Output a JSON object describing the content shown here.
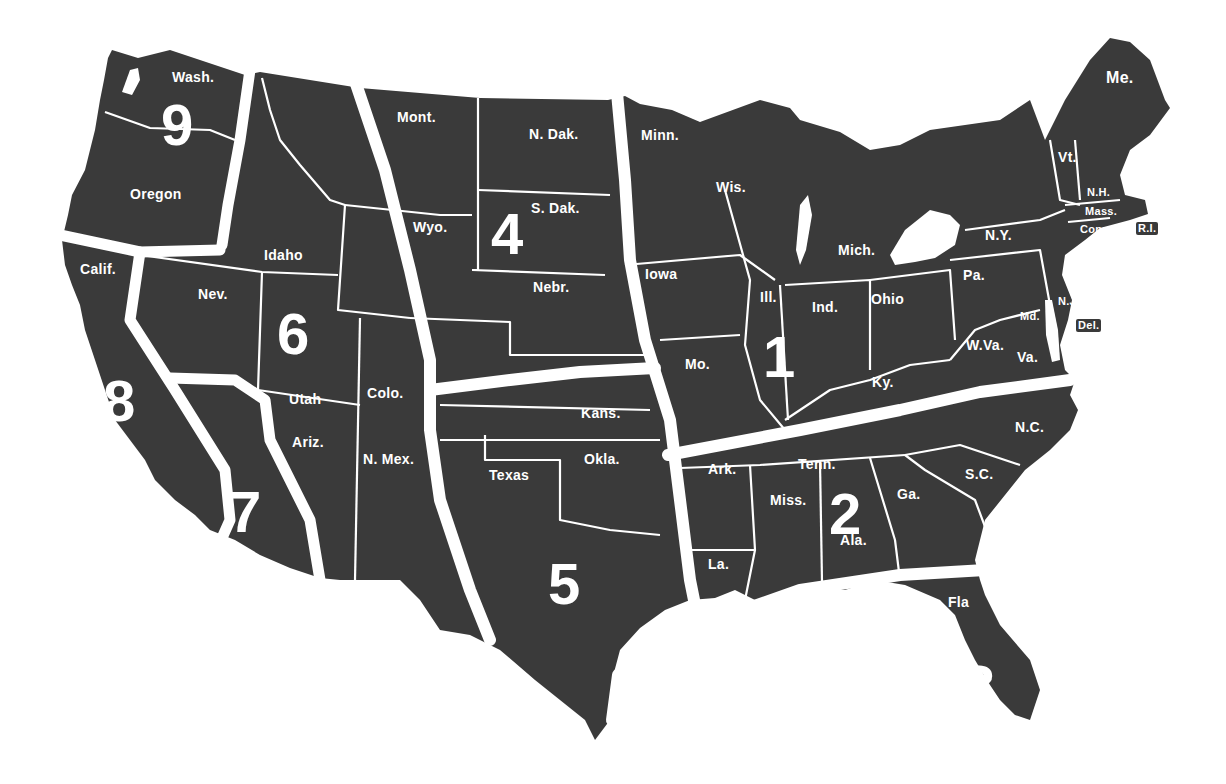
{
  "map": {
    "title": "U.S. Regions Map",
    "colors": {
      "land": "#3a3a3a",
      "divider": "#ffffff",
      "background": "#ffffff",
      "text": "#ffffff"
    },
    "regions": [
      {
        "number": "1",
        "x": 763,
        "y": 328
      },
      {
        "number": "2",
        "x": 829,
        "y": 485
      },
      {
        "number": "3",
        "x": 963,
        "y": 657
      },
      {
        "number": "4",
        "x": 491,
        "y": 205
      },
      {
        "number": "5",
        "x": 548,
        "y": 555
      },
      {
        "number": "6",
        "x": 277,
        "y": 305
      },
      {
        "number": "7",
        "x": 229,
        "y": 483
      },
      {
        "number": "8",
        "x": 103,
        "y": 372
      },
      {
        "number": "9",
        "x": 161,
        "y": 96
      }
    ],
    "states": [
      {
        "label": "Wash.",
        "x": 172,
        "y": 70,
        "size": "med"
      },
      {
        "label": "Oregon",
        "x": 130,
        "y": 187,
        "size": "med"
      },
      {
        "label": "Calif.",
        "x": 80,
        "y": 262,
        "size": "med"
      },
      {
        "label": "Idaho",
        "x": 264,
        "y": 248,
        "size": "med"
      },
      {
        "label": "Nev.",
        "x": 198,
        "y": 287,
        "size": "med"
      },
      {
        "label": "Utah",
        "x": 289,
        "y": 392,
        "size": "med"
      },
      {
        "label": "Ariz.",
        "x": 292,
        "y": 435,
        "size": "med"
      },
      {
        "label": "Mont.",
        "x": 397,
        "y": 110,
        "size": "med"
      },
      {
        "label": "Wyo.",
        "x": 413,
        "y": 220,
        "size": "med"
      },
      {
        "label": "Colo.",
        "x": 367,
        "y": 386,
        "size": "med"
      },
      {
        "label": "N. Mex.",
        "x": 363,
        "y": 452,
        "size": "med"
      },
      {
        "label": "N. Dak.",
        "x": 529,
        "y": 127,
        "size": "med"
      },
      {
        "label": "S. Dak.",
        "x": 531,
        "y": 201,
        "size": "med"
      },
      {
        "label": "Nebr.",
        "x": 533,
        "y": 280,
        "size": "med"
      },
      {
        "label": "Kans.",
        "x": 581,
        "y": 406,
        "size": "med"
      },
      {
        "label": "Okla.",
        "x": 584,
        "y": 452,
        "size": "med"
      },
      {
        "label": "Texas",
        "x": 489,
        "y": 468,
        "size": "med"
      },
      {
        "label": "Minn.",
        "x": 641,
        "y": 128,
        "size": "med"
      },
      {
        "label": "Iowa",
        "x": 645,
        "y": 267,
        "size": "med"
      },
      {
        "label": "Mo.",
        "x": 685,
        "y": 357,
        "size": "med"
      },
      {
        "label": "Ark.",
        "x": 708,
        "y": 462,
        "size": "med"
      },
      {
        "label": "La.",
        "x": 708,
        "y": 557,
        "size": "med"
      },
      {
        "label": "Wis.",
        "x": 716,
        "y": 180,
        "size": "med"
      },
      {
        "label": "Ill.",
        "x": 760,
        "y": 290,
        "size": "med"
      },
      {
        "label": "Ind.",
        "x": 812,
        "y": 300,
        "size": "med"
      },
      {
        "label": "Mich.",
        "x": 838,
        "y": 243,
        "size": "med"
      },
      {
        "label": "Ohio",
        "x": 871,
        "y": 292,
        "size": "med"
      },
      {
        "label": "Ky.",
        "x": 872,
        "y": 375,
        "size": "med"
      },
      {
        "label": "Tenn.",
        "x": 798,
        "y": 457,
        "size": "med"
      },
      {
        "label": "Miss.",
        "x": 770,
        "y": 493,
        "size": "med"
      },
      {
        "label": "Ala.",
        "x": 840,
        "y": 533,
        "size": "med"
      },
      {
        "label": "Ga.",
        "x": 897,
        "y": 487,
        "size": "med"
      },
      {
        "label": "Fla",
        "x": 948,
        "y": 595,
        "size": "med"
      },
      {
        "label": "S.C.",
        "x": 965,
        "y": 467,
        "size": "med"
      },
      {
        "label": "N.C.",
        "x": 1015,
        "y": 420,
        "size": "med"
      },
      {
        "label": "Va.",
        "x": 1017,
        "y": 350,
        "size": "med"
      },
      {
        "label": "W.Va.",
        "x": 966,
        "y": 338,
        "size": "med"
      },
      {
        "label": "Pa.",
        "x": 963,
        "y": 268,
        "size": "med"
      },
      {
        "label": "N.Y.",
        "x": 985,
        "y": 228,
        "size": "med"
      },
      {
        "label": "Vt.",
        "x": 1058,
        "y": 150,
        "size": "med"
      },
      {
        "label": "Me.",
        "x": 1106,
        "y": 70,
        "size": "big"
      },
      {
        "label": "N.H.",
        "x": 1087,
        "y": 187,
        "size": "small"
      },
      {
        "label": "Mass.",
        "x": 1085,
        "y": 206,
        "size": "small"
      },
      {
        "label": "Conn.",
        "x": 1080,
        "y": 224,
        "size": "small"
      },
      {
        "label": "R.I.",
        "x": 1136,
        "y": 222,
        "size": "small",
        "boxed": true
      },
      {
        "label": "N.J.",
        "x": 1058,
        "y": 296,
        "size": "small"
      },
      {
        "label": "Md.",
        "x": 1020,
        "y": 311,
        "size": "small"
      },
      {
        "label": "Del.",
        "x": 1076,
        "y": 319,
        "size": "small",
        "boxed": true
      }
    ]
  }
}
